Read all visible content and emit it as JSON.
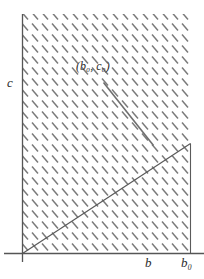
{
  "figure": {
    "title": "",
    "axes": {
      "y_label": "c",
      "x_label": "b",
      "x_label_secondary": "b₀"
    },
    "annotations": {
      "point_label": "(b₀, c₀)"
    },
    "colors": {
      "axis": "#555555",
      "hatch": "#7a7a7a",
      "line": "#555555",
      "segment": "#6b6b6b",
      "background": "#ffffff"
    }
  },
  "chart_data": {
    "type": "line",
    "title": "",
    "xlabel": "b",
    "ylabel": "c",
    "grid": false,
    "legend": "none",
    "xlim": [
      0,
      1
    ],
    "ylim": [
      0,
      1
    ],
    "hatched_region": {
      "description": "diagonally hatched feasible region",
      "hatch_angle_deg": -45,
      "hatch_spacing_px": 10,
      "bounds_px": {
        "left": 22,
        "right": 190,
        "top": 14,
        "bottom": 253
      }
    },
    "series": [
      {
        "name": "boundary-ray-from-origin",
        "type": "line",
        "points_px": [
          [
            22,
            253
          ],
          [
            190,
            143
          ]
        ]
      },
      {
        "name": "vertical-boundary-at-b0",
        "type": "line",
        "points_px": [
          [
            190,
            143
          ],
          [
            190,
            253
          ]
        ]
      },
      {
        "name": "segment-to-point",
        "type": "line",
        "points_px": [
          [
            103,
            82
          ],
          [
            153,
            145
          ]
        ]
      }
    ],
    "points": [
      {
        "label": "(b₀, c₀)",
        "x_px": 103,
        "y_px": 82
      }
    ],
    "axis_lines_px": {
      "y_axis": [
        [
          22,
          14
        ],
        [
          22,
          262
        ]
      ],
      "x_axis": [
        [
          4,
          253
        ],
        [
          204,
          253
        ]
      ]
    }
  }
}
